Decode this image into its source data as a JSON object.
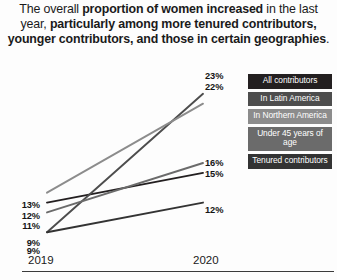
{
  "headline": {
    "segments": [
      {
        "text": "The overall ",
        "bold": false
      },
      {
        "text": "proportion of women increased",
        "bold": true
      },
      {
        "text": " in the last year, ",
        "bold": false
      },
      {
        "text": "particularly among more tenured contributors, younger contributors, and those in certain geographies",
        "bold": true
      },
      {
        "text": ".",
        "bold": false
      }
    ],
    "plain": "The overall proportion of women increased in the last year, particularly among more tenured contributors, younger contributors, and those in certain geographies."
  },
  "legend": {
    "items": [
      {
        "label": "All contributors",
        "color": "#231f20"
      },
      {
        "label": "In Latin America",
        "color": "#4d4d4d"
      },
      {
        "label": "In Northern America",
        "color": "#8c8c8c"
      },
      {
        "label": "Under 45 years of age",
        "color": "#6b6b6b"
      },
      {
        "label": "Tenured contributors",
        "color": "#333333"
      }
    ]
  },
  "chart_data": {
    "type": "line",
    "title": "",
    "xlabel": "",
    "ylabel": "",
    "categories": [
      "2019",
      "2020"
    ],
    "x": [
      2019,
      2020
    ],
    "ylim": [
      7,
      25
    ],
    "grid": false,
    "legend_position": "right",
    "value_suffix": "%",
    "series": [
      {
        "name": "All contributors",
        "values": [
          12,
          15
        ],
        "color": "#231f20",
        "label_left": "12%",
        "label_right": "15%"
      },
      {
        "name": "In Latin America",
        "values": [
          9,
          23
        ],
        "color": "#4d4d4d",
        "label_left": "9%",
        "label_right": "23%"
      },
      {
        "name": "In Northern America",
        "values": [
          13,
          22
        ],
        "color": "#8c8c8c",
        "label_left": "13%",
        "label_right": "22%"
      },
      {
        "name": "Under 45 years of age",
        "values": [
          11,
          16
        ],
        "color": "#6b6b6b",
        "label_left": "11%",
        "label_right": "16%"
      },
      {
        "name": "Tenured contributors",
        "values": [
          9,
          12
        ],
        "color": "#333333",
        "label_left": "9%",
        "label_right": "12%"
      }
    ],
    "left_labels": [
      "13%",
      "12%",
      "11%",
      "9%",
      "9%"
    ],
    "right_labels": [
      "23%",
      "22%",
      "16%",
      "15%",
      "12%"
    ]
  },
  "axis": {
    "ticks": [
      "2019",
      "2020"
    ]
  }
}
